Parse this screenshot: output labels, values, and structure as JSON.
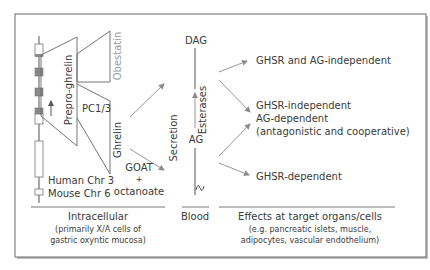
{
  "diagram": {
    "gene": {
      "label_line1": "Human Chr 3",
      "label_line2": "Mouse Chr 6"
    },
    "precursors": {
      "prepro_ghrelin": "Prepro-ghrelin",
      "obestatin": "Obestatin",
      "pc13": "PC1/3",
      "ghrelin": "Ghrelin"
    },
    "acylation": {
      "line1": "GOAT",
      "line2": "+",
      "line3": "octanoate"
    },
    "blood": {
      "secretion": "Secretion",
      "dag": "DAG",
      "ag": "AG",
      "esterases": "Esterases"
    },
    "effects": [
      {
        "lines": [
          "GHSR and AG-independent"
        ]
      },
      {
        "lines": [
          "GHSR-independent",
          "AG-dependent",
          "(antagonistic and cooperative)"
        ]
      },
      {
        "lines": [
          "GHSR-dependent"
        ]
      }
    ],
    "columns": {
      "intracellular": {
        "title": "Intracellular",
        "sub1": "(primarily X/A cells of",
        "sub2": "gastric oxyntic mucosa)"
      },
      "blood": {
        "title": "Blood"
      },
      "target": {
        "title": "Effects at target organs/cells",
        "sub1": "(e.g. pancreatic islets, muscle,",
        "sub2": "adipocytes, vascular endothelium)"
      }
    },
    "colors": {
      "line": "#555555",
      "text": "#3a3a3a",
      "obestatin_text": "#9a9a9a",
      "exon_grey": "#8a8a8a",
      "arrow": "#8c8c8c"
    }
  }
}
